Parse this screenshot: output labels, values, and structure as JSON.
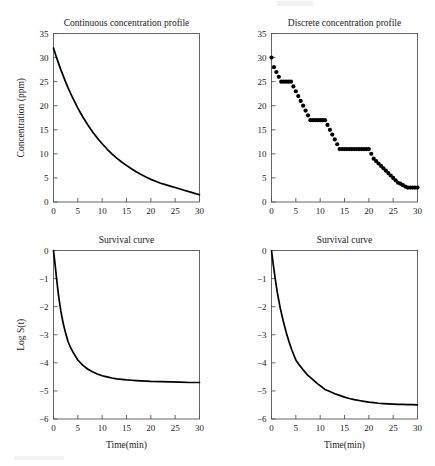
{
  "figure": {
    "width": 435,
    "height": 466,
    "background": "#ffffff",
    "line_color": "#000000",
    "frame_color": "#555555",
    "text_color": "#1a1a1a"
  },
  "chart_data": [
    {
      "id": "continuous-concentration",
      "type": "line",
      "title": "Continuous concentration profile",
      "xlabel": "",
      "ylabel": "Concentration (ppm)",
      "xlim": [
        0,
        30
      ],
      "ylim": [
        0,
        35
      ],
      "xticks": [
        0,
        5,
        10,
        15,
        20,
        25,
        30
      ],
      "yticks": [
        0,
        5,
        10,
        15,
        20,
        25,
        30,
        35
      ],
      "xticklabels": [
        "0",
        "5",
        "10",
        "15",
        "20",
        "25",
        "30"
      ],
      "yticklabels": [
        "0",
        "5",
        "10",
        "15",
        "20",
        "25",
        "30",
        "35"
      ],
      "grid": false,
      "legend": null,
      "x": [
        0,
        0.5,
        1,
        1.5,
        2,
        2.5,
        3,
        4,
        5,
        6,
        7,
        8,
        9,
        10,
        11,
        12,
        13,
        14,
        15,
        16,
        17,
        18,
        19,
        20,
        21,
        22,
        23,
        24,
        25,
        26,
        27,
        28,
        29,
        30
      ],
      "y": [
        32.0,
        30.4,
        28.9,
        27.5,
        26.2,
        24.9,
        23.7,
        21.5,
        19.5,
        17.7,
        16.1,
        14.6,
        13.3,
        12.1,
        11.0,
        10.0,
        9.1,
        8.3,
        7.6,
        6.9,
        6.3,
        5.7,
        5.2,
        4.7,
        4.3,
        3.9,
        3.6,
        3.3,
        3.0,
        2.7,
        2.4,
        2.1,
        1.8,
        1.5
      ]
    },
    {
      "id": "discrete-concentration",
      "type": "scatter",
      "title": "Discrete concentration profile",
      "xlabel": "",
      "ylabel": "",
      "xlim": [
        0,
        30
      ],
      "ylim": [
        0,
        35
      ],
      "xticks": [
        0,
        5,
        10,
        15,
        20,
        25,
        30
      ],
      "yticks": [
        0,
        5,
        10,
        15,
        20,
        25,
        30,
        35
      ],
      "xticklabels": [
        "0",
        "5",
        "10",
        "15",
        "20",
        "25",
        "30"
      ],
      "yticklabels": [
        "0",
        "5",
        "10",
        "15",
        "20",
        "25",
        "30",
        "35"
      ],
      "grid": false,
      "legend": null,
      "marker": "filled-circle",
      "x": [
        0,
        0.5,
        1,
        1.5,
        2,
        2.5,
        3,
        3.5,
        4,
        4.5,
        5,
        5.5,
        6,
        6.5,
        7,
        7.5,
        8,
        8.5,
        9,
        9.5,
        10,
        10.5,
        11,
        11.5,
        12,
        12.5,
        13,
        13.5,
        14,
        14.5,
        15,
        15.5,
        16,
        16.5,
        17,
        17.5,
        18,
        18.5,
        19,
        19.5,
        20,
        20.5,
        21,
        21.5,
        22,
        22.5,
        23,
        23.5,
        24,
        24.5,
        25,
        25.5,
        26,
        26.5,
        27,
        27.5,
        28,
        28.5,
        29,
        29.5,
        30
      ],
      "y": [
        30,
        28,
        27,
        26,
        25,
        25,
        25,
        25,
        25,
        24,
        23,
        22,
        21,
        20,
        19,
        18,
        17,
        17,
        17,
        17,
        17,
        17,
        17,
        16,
        15,
        14,
        13,
        12,
        11,
        11,
        11,
        11,
        11,
        11,
        11,
        11,
        11,
        11,
        11,
        11,
        11,
        10,
        9,
        8.5,
        8,
        7.5,
        7,
        6.5,
        6,
        5.5,
        5,
        4.5,
        4,
        3.8,
        3.5,
        3.2,
        3,
        3,
        3,
        3,
        3
      ]
    },
    {
      "id": "survival-curve-left",
      "type": "line",
      "title": "Survival curve",
      "xlabel": "Time(min)",
      "ylabel": "Log S(t)",
      "xlim": [
        0,
        30
      ],
      "ylim": [
        -6,
        0
      ],
      "xticks": [
        0,
        5,
        10,
        15,
        20,
        25,
        30
      ],
      "yticks": [
        -6,
        -5,
        -4,
        -3,
        -2,
        -1,
        0
      ],
      "xticklabels": [
        "0",
        "5",
        "10",
        "15",
        "20",
        "25",
        "30"
      ],
      "yticklabels": [
        "−6",
        "−5",
        "−4",
        "−3",
        "−2",
        "−1",
        "0"
      ],
      "grid": false,
      "legend": null,
      "x": [
        0,
        0.3,
        0.6,
        1,
        1.5,
        2,
        2.5,
        3,
        3.5,
        4,
        5,
        6,
        7,
        8,
        9,
        10,
        11,
        12,
        13,
        14,
        15,
        16,
        17,
        18,
        19,
        20,
        22,
        24,
        26,
        28,
        30
      ],
      "y": [
        0,
        -0.45,
        -0.95,
        -1.55,
        -2.15,
        -2.6,
        -2.95,
        -3.25,
        -3.45,
        -3.62,
        -3.9,
        -4.08,
        -4.22,
        -4.32,
        -4.4,
        -4.46,
        -4.5,
        -4.54,
        -4.57,
        -4.59,
        -4.61,
        -4.62,
        -4.63,
        -4.64,
        -4.65,
        -4.66,
        -4.67,
        -4.68,
        -4.69,
        -4.7,
        -4.7
      ]
    },
    {
      "id": "survival-curve-right",
      "type": "line",
      "title": "Survival curve",
      "xlabel": "Time(min)",
      "ylabel": "",
      "xlim": [
        0,
        30
      ],
      "ylim": [
        -6,
        0
      ],
      "xticks": [
        0,
        5,
        10,
        15,
        20,
        25,
        30
      ],
      "yticks": [
        -6,
        -5,
        -4,
        -3,
        -2,
        -1,
        0
      ],
      "xticklabels": [
        "0",
        "5",
        "10",
        "15",
        "20",
        "25",
        "30"
      ],
      "yticklabels": [
        "−6",
        "−5",
        "−4",
        "−3",
        "−2",
        "−1",
        "0"
      ],
      "grid": false,
      "legend": null,
      "x": [
        0,
        0.4,
        0.8,
        1.2,
        1.8,
        2.4,
        3,
        3.6,
        4.2,
        5,
        5.6,
        6.5,
        7.5,
        8.5,
        9.5,
        10.5,
        11,
        12,
        13,
        14,
        15,
        16,
        17,
        18,
        19,
        20,
        21,
        22,
        23,
        24,
        25,
        26,
        27,
        28,
        29,
        30
      ],
      "y": [
        0,
        -0.55,
        -1.05,
        -1.5,
        -2.05,
        -2.5,
        -2.9,
        -3.25,
        -3.55,
        -3.9,
        -4.05,
        -4.25,
        -4.45,
        -4.6,
        -4.75,
        -4.88,
        -4.95,
        -5.02,
        -5.1,
        -5.16,
        -5.22,
        -5.27,
        -5.31,
        -5.34,
        -5.37,
        -5.4,
        -5.42,
        -5.44,
        -5.45,
        -5.46,
        -5.47,
        -5.48,
        -5.48,
        -5.49,
        -5.49,
        -5.5
      ]
    }
  ]
}
